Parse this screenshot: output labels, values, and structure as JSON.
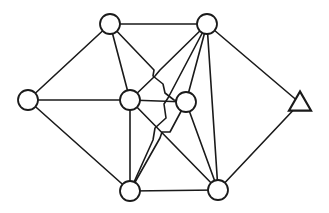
{
  "diagram": {
    "type": "graph",
    "colors": {
      "stroke": "#1a1a1a",
      "background": "#ffffff",
      "node_fill": "#ffffff"
    },
    "nodes": [
      {
        "id": "top-left",
        "shape": "circle",
        "x": 110,
        "y": 24,
        "r": 10
      },
      {
        "id": "top-right",
        "shape": "circle",
        "x": 207,
        "y": 24,
        "r": 10
      },
      {
        "id": "left",
        "shape": "circle",
        "x": 28,
        "y": 100,
        "r": 10
      },
      {
        "id": "mid-left",
        "shape": "circle",
        "x": 130,
        "y": 100,
        "r": 10
      },
      {
        "id": "mid-right",
        "shape": "circle",
        "x": 186,
        "y": 102,
        "r": 10
      },
      {
        "id": "bottom-left",
        "shape": "circle",
        "x": 130,
        "y": 191,
        "r": 10
      },
      {
        "id": "bottom-right",
        "shape": "circle",
        "x": 218,
        "y": 190,
        "r": 10
      },
      {
        "id": "triangle",
        "shape": "triangle",
        "x": 300,
        "y": 103,
        "size": 22
      }
    ],
    "edges": [
      {
        "from": "top-left",
        "to": "top-right",
        "path": "M110,24 L207,24"
      },
      {
        "from": "top-left",
        "to": "left",
        "path": "M110,24 L28,100"
      },
      {
        "from": "top-left",
        "to": "mid-left",
        "path": "M110,24 L130,100"
      },
      {
        "from": "top-left",
        "to": "mid-right",
        "path": "M110,24 L154,70 L153,76 L163,84 L165,93 L174,100 L186,102"
      },
      {
        "from": "left",
        "to": "mid-left",
        "path": "M28,100 L130,100"
      },
      {
        "from": "left",
        "to": "bottom-left",
        "path": "M28,100 L130,191"
      },
      {
        "from": "mid-left",
        "to": "mid-right",
        "path": "M130,100 L186,102"
      },
      {
        "from": "mid-left",
        "to": "bottom-left",
        "path": "M130,100 L130,191"
      },
      {
        "from": "mid-left",
        "to": "bottom-right",
        "path": "M130,100 L218,190"
      },
      {
        "from": "mid-left",
        "to": "top-right",
        "path": "M130,100 L155,76 L160,70 L207,24"
      },
      {
        "from": "top-right",
        "to": "mid-right",
        "path": "M207,24 L186,102"
      },
      {
        "from": "top-right",
        "to": "bottom-left",
        "path": "M207,24 L168,98 L164,104 L166,118 L155,128 L153,140 L130,191"
      },
      {
        "from": "top-right",
        "to": "bottom-right",
        "path": "M207,24 L218,190"
      },
      {
        "from": "top-right",
        "to": "triangle",
        "path": "M207,24 L300,103"
      },
      {
        "from": "mid-right",
        "to": "bottom-left",
        "path": "M186,102 L170,132 L162,132 L160,138 L130,191"
      },
      {
        "from": "mid-right",
        "to": "bottom-right",
        "path": "M186,102 L218,190"
      },
      {
        "from": "bottom-left",
        "to": "bottom-right",
        "path": "M130,191 L218,190"
      },
      {
        "from": "bottom-right",
        "to": "triangle",
        "path": "M218,190 L300,103"
      }
    ]
  }
}
